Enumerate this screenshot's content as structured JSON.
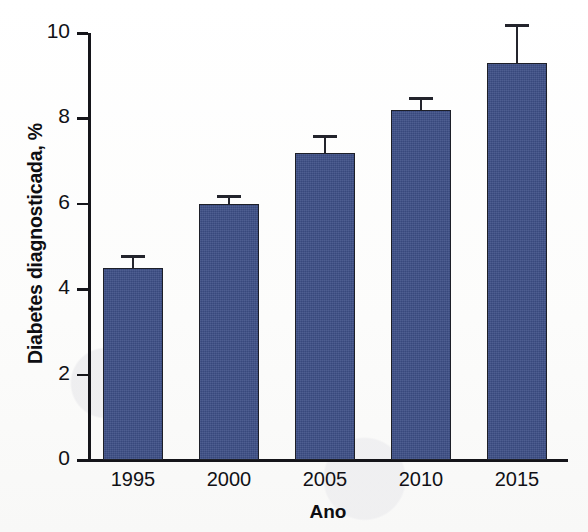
{
  "chart_data": {
    "type": "bar",
    "title": "",
    "subtitle": "",
    "xlabel": "Ano",
    "ylabel": "Diabetes diagnosticada, %",
    "categories": [
      "1995",
      "2000",
      "2005",
      "2010",
      "2015"
    ],
    "values": [
      4.5,
      6.0,
      7.2,
      8.2,
      9.3
    ],
    "errors": [
      0.3,
      0.2,
      0.4,
      0.3,
      0.9
    ],
    "series": [
      {
        "name": "Diabetes diagnosticada",
        "values": [
          4.5,
          6.0,
          7.2,
          8.2,
          9.3
        ],
        "errors": [
          0.3,
          0.2,
          0.4,
          0.3,
          0.9
        ]
      }
    ],
    "ylim": [
      0,
      10
    ],
    "yticks": [
      0,
      2,
      4,
      6,
      8,
      10
    ],
    "ytick_labels": [
      "0",
      "2",
      "4",
      "6",
      "8",
      "10"
    ],
    "xtick_labels": [
      "1995",
      "2000",
      "2005",
      "2010",
      "2015"
    ],
    "grid": false,
    "legend": false,
    "legend_position": "none",
    "error_bar_style": "upper-only-cap",
    "bar_color": "#3d4f87",
    "bar_edge_color": "#1d1f28",
    "axis_color": "#15151a",
    "background_color": "#fdfdfc"
  },
  "axis": {
    "y_title": "Diabetes diagnosticada, %",
    "x_title": "Ano"
  },
  "y_ticks": [
    {
      "label": "10",
      "value": 10
    },
    {
      "label": "8",
      "value": 8
    },
    {
      "label": "6",
      "value": 6
    },
    {
      "label": "4",
      "value": 4
    },
    {
      "label": "2",
      "value": 2
    },
    {
      "label": "0",
      "value": 0
    }
  ],
  "bars": [
    {
      "category": "1995",
      "value": 4.5,
      "error": 0.3
    },
    {
      "category": "2000",
      "value": 6.0,
      "error": 0.2
    },
    {
      "category": "2005",
      "value": 7.2,
      "error": 0.4
    },
    {
      "category": "2010",
      "value": 8.2,
      "error": 0.3
    },
    {
      "category": "2015",
      "value": 9.3,
      "error": 0.9
    }
  ]
}
